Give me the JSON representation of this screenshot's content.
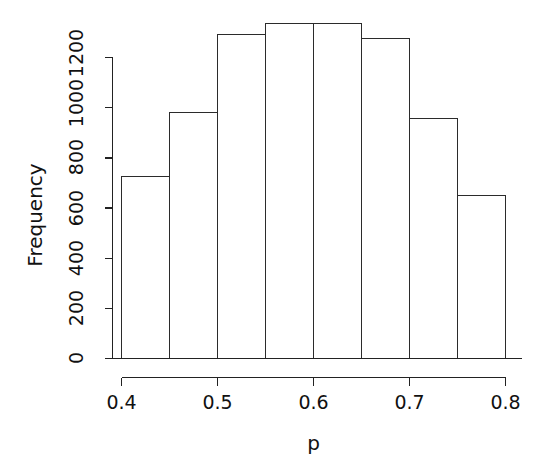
{
  "chart_data": {
    "type": "bar",
    "subtype": "histogram",
    "title": "",
    "xlabel": "p",
    "ylabel": "Frequency",
    "categories": [
      "0.40-0.45",
      "0.45-0.50",
      "0.50-0.55",
      "0.55-0.60",
      "0.60-0.65",
      "0.65-0.70",
      "0.70-0.75",
      "0.75-0.80"
    ],
    "bin_edges": [
      0.4,
      0.45,
      0.5,
      0.55,
      0.6,
      0.65,
      0.7,
      0.75,
      0.8
    ],
    "values": [
      726,
      981,
      1292,
      1336,
      1336,
      1276,
      957,
      650
    ],
    "xlim": [
      0.4,
      0.8
    ],
    "ylim": [
      0,
      1200
    ],
    "x_ticks": [
      0.4,
      0.5,
      0.6,
      0.7,
      0.8
    ],
    "x_tick_labels": [
      "0.4",
      "0.5",
      "0.6",
      "0.7",
      "0.8"
    ],
    "y_ticks": [
      0,
      200,
      400,
      600,
      800,
      1000,
      1200
    ],
    "y_tick_labels": [
      "0",
      "200",
      "400",
      "600",
      "800",
      "1000",
      "1200"
    ],
    "grid": false,
    "legend": false,
    "bar_fill": "#ffffff",
    "bar_stroke": "#2b2b2b",
    "axis_color": "#222222",
    "background": "#ffffff"
  },
  "axes": {
    "y_title": "Frequency",
    "x_title": "p"
  },
  "y_tick_labels": {
    "t0": "0",
    "t1": "200",
    "t2": "400",
    "t3": "600",
    "t4": "800",
    "t5": "1000",
    "t6": "1200"
  },
  "x_tick_labels": {
    "t0": "0.4",
    "t1": "0.5",
    "t2": "0.6",
    "t3": "0.7",
    "t4": "0.8"
  }
}
